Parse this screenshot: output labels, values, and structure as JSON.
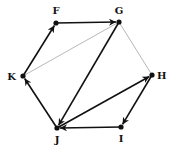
{
  "diagram": {
    "type": "directed-graph",
    "nodes": [
      {
        "id": "F",
        "label": "F",
        "x": 56,
        "y": 23,
        "lx": 56,
        "ly": 14,
        "anchor": "middle"
      },
      {
        "id": "G",
        "label": "G",
        "x": 119,
        "y": 22,
        "lx": 119,
        "ly": 14,
        "anchor": "middle"
      },
      {
        "id": "H",
        "label": "H",
        "x": 152,
        "y": 75,
        "lx": 157,
        "ly": 79,
        "anchor": "start"
      },
      {
        "id": "I",
        "label": "I",
        "x": 121,
        "y": 127,
        "lx": 121,
        "ly": 142,
        "anchor": "middle"
      },
      {
        "id": "J",
        "label": "J",
        "x": 57,
        "y": 128,
        "lx": 57,
        "ly": 143,
        "anchor": "middle"
      },
      {
        "id": "K",
        "label": "K",
        "x": 23,
        "y": 76,
        "lx": 16,
        "ly": 80,
        "anchor": "end"
      }
    ],
    "edges": [
      {
        "from": "F",
        "to": "G",
        "directed": true,
        "color": "#111111"
      },
      {
        "from": "K",
        "to": "F",
        "directed": true,
        "color": "#111111"
      },
      {
        "from": "G",
        "to": "J",
        "directed": true,
        "color": "#111111"
      },
      {
        "from": "J",
        "to": "K",
        "directed": true,
        "color": "#111111"
      },
      {
        "from": "J",
        "to": "H",
        "directed": true,
        "color": "#111111"
      },
      {
        "from": "H",
        "to": "I",
        "directed": true,
        "color": "#111111"
      },
      {
        "from": "I",
        "to": "J",
        "directed": true,
        "color": "#111111"
      },
      {
        "from": "K",
        "to": "G",
        "directed": false,
        "color": "#b8b8b8"
      },
      {
        "from": "G",
        "to": "H",
        "directed": false,
        "color": "#b8b8b8"
      }
    ]
  }
}
